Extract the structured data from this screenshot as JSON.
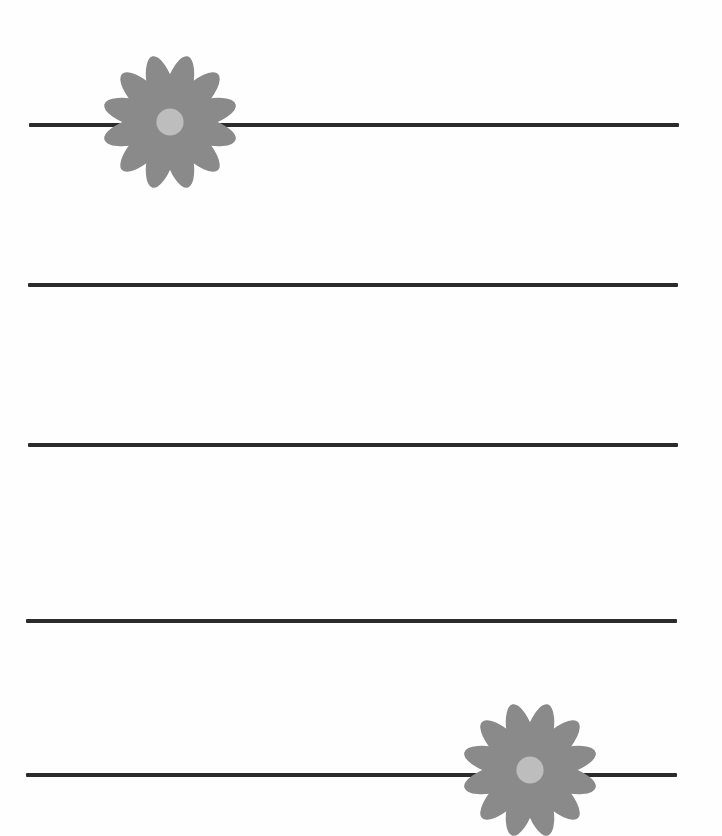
{
  "document": {
    "type": "lined-stationery-page",
    "background_color": "#fefefe"
  },
  "colors": {
    "rule": "#2b2b2b",
    "petal": "#8a8a8a",
    "flower_center": "#bdbdbd"
  },
  "rules": [
    {
      "y": 123,
      "x1": 29,
      "x2": 679
    },
    {
      "y": 283,
      "x1": 28,
      "x2": 678
    },
    {
      "y": 443,
      "x1": 28,
      "x2": 678
    },
    {
      "y": 619,
      "x1": 26,
      "x2": 677
    },
    {
      "y": 773,
      "x1": 26,
      "x2": 677
    }
  ],
  "decorations": [
    {
      "name": "daisy-top-left",
      "cx": 170,
      "cy": 122,
      "petal_count": 12,
      "radius": 68
    },
    {
      "name": "daisy-bottom-right",
      "cx": 530,
      "cy": 770,
      "petal_count": 12,
      "radius": 68
    }
  ]
}
